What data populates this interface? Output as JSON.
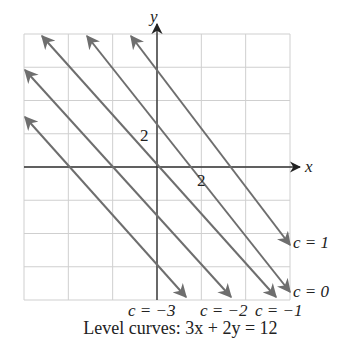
{
  "figure": {
    "caption": "Level curves: 3x + 2y = 12",
    "axes": {
      "x_label": "x",
      "y_label": "y",
      "x_tick_label": "2",
      "y_tick_label": "2"
    },
    "colors": {
      "grid": "#cfcfcf",
      "axis": "#333333",
      "curve": "#6e6e6e",
      "text": "#222222"
    },
    "grid": {
      "left": 24,
      "right": 290,
      "top": 34,
      "bottom": 300,
      "cols": 6,
      "rows": 8,
      "origin_x": 157,
      "origin_y": 167
    },
    "curves": [
      {
        "label": "c = 1",
        "x1": 131,
        "y1": 36,
        "x2": 290,
        "y2": 245
      },
      {
        "label": "c = 0",
        "x1": 87,
        "y1": 36,
        "x2": 290,
        "y2": 292
      },
      {
        "label": "c = −1",
        "x1": 42,
        "y1": 36,
        "x2": 276,
        "y2": 297
      },
      {
        "label": "c = −2",
        "x1": 25,
        "y1": 70,
        "x2": 231,
        "y2": 297
      },
      {
        "label": "c = −3",
        "x1": 25,
        "y1": 117,
        "x2": 186,
        "y2": 297
      }
    ]
  },
  "chart_data": {
    "type": "line",
    "title": "Level curves: 3x + 2y = 12",
    "xlabel": "x",
    "ylabel": "y",
    "grid": true,
    "series": [
      {
        "name": "c = 1"
      },
      {
        "name": "c = 0"
      },
      {
        "name": "c = −1"
      },
      {
        "name": "c = −2"
      },
      {
        "name": "c = −3"
      }
    ]
  }
}
